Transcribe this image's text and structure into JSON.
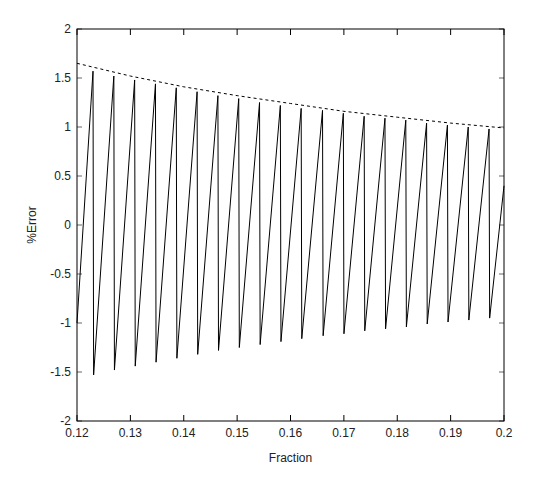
{
  "chart_data": {
    "type": "line",
    "title": "",
    "xlabel": "Fraction",
    "ylabel": "%Error",
    "xlim": [
      0.12,
      0.2
    ],
    "ylim": [
      -2,
      2
    ],
    "grid": false,
    "legend": null,
    "x_ticks": [
      0.12,
      0.13,
      0.14,
      0.15,
      0.16,
      0.17,
      0.18,
      0.19,
      0.2
    ],
    "x_tick_labels": [
      "0.12",
      "0.13",
      "0.14",
      "0.15",
      "0.16",
      "0.17",
      "0.18",
      "0.19",
      "0.2"
    ],
    "y_ticks": [
      -2,
      -1.5,
      -1,
      -0.5,
      0,
      0.5,
      1,
      1.5,
      2
    ],
    "y_tick_labels": [
      "-2",
      "-1.5",
      "-1",
      "-0.5",
      "0",
      "0.5",
      "1",
      "1.5",
      "2"
    ],
    "series": [
      {
        "name": "error",
        "style": "solid",
        "color": "#000000",
        "shape": "sawtooth (gradual rise, sharp drop at each peak)",
        "start": {
          "x": 0.12,
          "y": -1.0
        },
        "end": {
          "x": 0.2,
          "y": 0.4
        },
        "peaks_x": [
          0.123,
          0.1269,
          0.1308,
          0.1347,
          0.1386,
          0.1425,
          0.1464,
          0.1503,
          0.1542,
          0.1581,
          0.162,
          0.166,
          0.1699,
          0.1738,
          0.1777,
          0.1816,
          0.1855,
          0.1894,
          0.1933,
          0.1972
        ],
        "peaks_y": [
          1.57,
          1.52,
          1.48,
          1.44,
          1.4,
          1.36,
          1.32,
          1.29,
          1.25,
          1.22,
          1.19,
          1.17,
          1.14,
          1.11,
          1.09,
          1.07,
          1.04,
          1.02,
          1.0,
          0.98
        ],
        "troughs_y": [
          -1.53,
          -1.48,
          -1.44,
          -1.4,
          -1.36,
          -1.32,
          -1.28,
          -1.25,
          -1.22,
          -1.19,
          -1.16,
          -1.13,
          -1.11,
          -1.08,
          -1.06,
          -1.04,
          -1.01,
          -0.99,
          -0.97,
          -0.95
        ]
      },
      {
        "name": "envelope",
        "style": "dashed",
        "color": "#000000",
        "x": [
          0.12,
          0.13,
          0.14,
          0.15,
          0.16,
          0.17,
          0.18,
          0.19,
          0.2
        ],
        "y": [
          1.65,
          1.52,
          1.41,
          1.32,
          1.24,
          1.16,
          1.1,
          1.04,
          0.99
        ]
      }
    ]
  }
}
